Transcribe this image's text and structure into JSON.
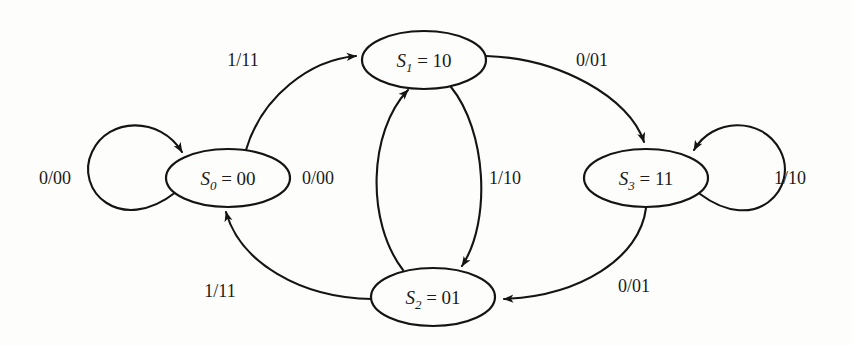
{
  "figure": {
    "kind": "state-transition-diagram",
    "machine_type": "Mealy finite state machine",
    "label_format": "input/output",
    "background_color": "#fdfdfb",
    "stroke_color": "#141414"
  },
  "states": [
    {
      "id": "S0",
      "var": "S",
      "subscript": "0",
      "equals": "=",
      "encoding": "00",
      "full_label": "S0 = 00",
      "cx": 228,
      "cy": 178,
      "rx": 62,
      "ry": 29
    },
    {
      "id": "S1",
      "var": "S",
      "subscript": "1",
      "equals": "=",
      "encoding": "10",
      "full_label": "S1 = 10",
      "cx": 424,
      "cy": 60,
      "rx": 62,
      "ry": 29
    },
    {
      "id": "S2",
      "var": "S",
      "subscript": "2",
      "equals": "=",
      "encoding": "01",
      "full_label": "S2 = 01",
      "cx": 433,
      "cy": 297,
      "rx": 62,
      "ry": 29
    },
    {
      "id": "S3",
      "var": "S",
      "subscript": "3",
      "equals": "=",
      "encoding": "11",
      "full_label": "S3 = 11",
      "cx": 646,
      "cy": 178,
      "rx": 62,
      "ry": 29
    }
  ],
  "transitions": [
    {
      "id": "t-s0-s0",
      "from": "S0",
      "to": "S0",
      "input": "0",
      "output": "00",
      "label": "0/00",
      "label_x": 55,
      "label_y": 184,
      "kind": "self-loop-left"
    },
    {
      "id": "t-s0-s1",
      "from": "S0",
      "to": "S1",
      "input": "1",
      "output": "11",
      "label": "1/11",
      "label_x": 243,
      "label_y": 66,
      "kind": "arc-top-left"
    },
    {
      "id": "t-s1-s3",
      "from": "S1",
      "to": "S3",
      "input": "0",
      "output": "01",
      "label": "0/01",
      "label_x": 592,
      "label_y": 66,
      "kind": "arc-top-right"
    },
    {
      "id": "t-s1-s2",
      "from": "S1",
      "to": "S2",
      "input": "1",
      "output": "10",
      "label": "1/10",
      "label_x": 505,
      "label_y": 184,
      "kind": "vertical-right"
    },
    {
      "id": "t-s2-s1",
      "from": "S2",
      "to": "S1",
      "input": "0",
      "output": "00",
      "label": "0/00",
      "label_x": 318,
      "label_y": 184,
      "kind": "vertical-left"
    },
    {
      "id": "t-s2-s0",
      "from": "S2",
      "to": "S0",
      "input": "1",
      "output": "11",
      "label": "1/11",
      "label_x": 220,
      "label_y": 297,
      "kind": "arc-bottom-left"
    },
    {
      "id": "t-s3-s3",
      "from": "S3",
      "to": "S3",
      "input": "1",
      "output": "10",
      "label": "1/10",
      "label_x": 790,
      "label_y": 184,
      "kind": "self-loop-right"
    },
    {
      "id": "t-s3-s2",
      "from": "S3",
      "to": "S2",
      "input": "0",
      "output": "01",
      "label": "0/01",
      "label_x": 634,
      "label_y": 292,
      "kind": "arc-bottom-right"
    }
  ]
}
